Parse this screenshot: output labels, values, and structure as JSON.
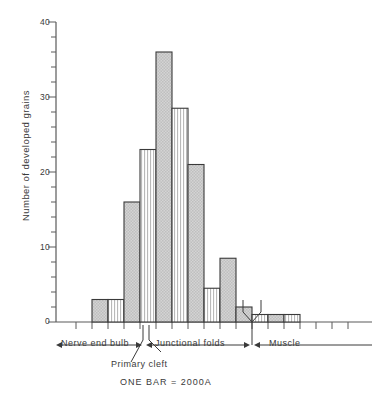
{
  "chart_data": {
    "type": "bar",
    "title": "",
    "xlabel": "",
    "ylabel": "Number of developed grains",
    "ylim": [
      0,
      40
    ],
    "yticks": [
      0,
      10,
      20,
      30,
      40
    ],
    "ytick_labels": [
      "0",
      "10",
      "20",
      "30",
      "40"
    ],
    "minor_tick_step": 2,
    "grid": false,
    "legend": "none",
    "bar_unit_note": "ONE BAR = 2000A",
    "categories": [
      "1",
      "2",
      "3",
      "4",
      "5",
      "6",
      "7",
      "8",
      "9",
      "10",
      "11",
      "12",
      "13"
    ],
    "values": [
      3,
      3,
      16,
      23,
      36,
      28.5,
      21,
      4.5,
      8.5,
      2,
      1,
      1,
      1
    ],
    "fills": [
      "solid",
      "striped",
      "solid",
      "striped",
      "solid",
      "striped",
      "solid",
      "striped",
      "solid",
      "solid",
      "striped",
      "solid",
      "striped"
    ],
    "region_labels": [
      "Nerve end bulb",
      "Junctional folds",
      "Muscle"
    ],
    "annotations": [
      "Primary cleft"
    ]
  },
  "axis": {
    "y_label": "Number of developed grains",
    "tick_40": "40",
    "tick_30": "30",
    "tick_20": "20",
    "tick_10": "10",
    "tick_0": "0"
  },
  "regions": {
    "nerve_end_bulb": "Nerve end bulb",
    "junctional_folds": "Junctional folds",
    "muscle": "Muscle",
    "primary_cleft": "Primary cleft"
  },
  "caption": {
    "scale_note": "ONE BAR = 2000A"
  },
  "colors": {
    "bar_fill": "#c9c9c9",
    "bar_stroke": "#3a3a3a",
    "axis": "#5a5a5a",
    "text": "#3a3a3a"
  }
}
